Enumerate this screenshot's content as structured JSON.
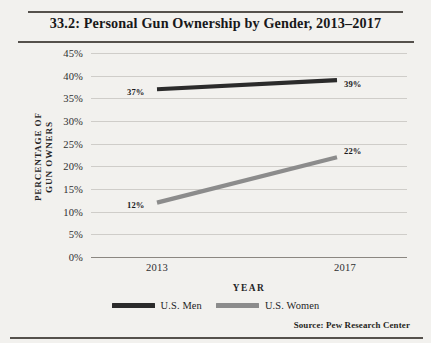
{
  "chart_data": {
    "type": "line",
    "title": "33.2: Personal Gun Ownership by Gender, 2013–2017",
    "xlabel": "YEAR",
    "ylabel_line1": "PERCENTAGE OF",
    "ylabel_line2": "GUN OWNERS",
    "x": [
      "2013",
      "2017"
    ],
    "categories": [
      "2013",
      "2017"
    ],
    "ylim": [
      0,
      45
    ],
    "ytick_labels": [
      "45%",
      "40%",
      "35%",
      "30%",
      "25%",
      "20%",
      "15%",
      "10%",
      "5%",
      "0%"
    ],
    "ytick_values": [
      45,
      40,
      35,
      30,
      25,
      20,
      15,
      10,
      5,
      0
    ],
    "grid": true,
    "legend_position": "bottom-center",
    "series": [
      {
        "name": "U.S. Men",
        "color": "#2b2b2b",
        "values": [
          37,
          22222
        ],
        "point_labels": [
          "37%",
          "39%"
        ]
      },
      {
        "name": "U.S. Women",
        "color": "#8c8c8c",
        "values": [
          12,
          22
        ],
        "point_labels": [
          "12%",
          "22%"
        ]
      }
    ],
    "annotations": [],
    "source": "Source: Pew Research Center"
  },
  "figure": {
    "title": "33.2: Personal Gun Ownership by Gender, 2013–2017",
    "source": "Source: Pew Research Center"
  },
  "axes": {
    "y_title_line1": "PERCENTAGE OF",
    "y_title_line2": "GUN OWNERS",
    "x_title": "YEAR",
    "x_ticks": [
      "2013",
      "2017"
    ],
    "y_ticks": [
      "45%",
      "40%",
      "35%",
      "30%",
      "25%",
      "20%",
      "15%",
      "10%",
      "5%",
      "0%"
    ]
  },
  "legend": {
    "items": [
      {
        "label": "U.S. Men",
        "color": "#2b2b2b"
      },
      {
        "label": "U.S. Women",
        "color": "#8c8c8c"
      }
    ]
  },
  "point_labels": {
    "men_2013": "37%",
    "men_2017": "39%",
    "women_2013": "12%",
    "women_2017": "22%"
  }
}
